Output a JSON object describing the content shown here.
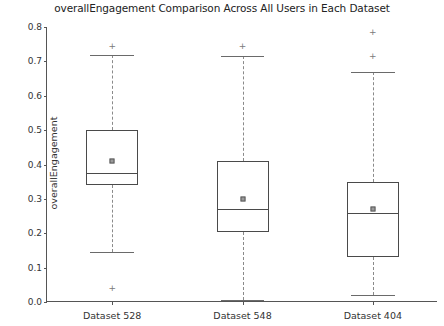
{
  "chart_data": {
    "type": "box",
    "title": "overallEngagement Comparison Across All Users in Each Dataset",
    "xlabel": "",
    "ylabel": "overallEngagement",
    "ylim": [
      0.0,
      0.8
    ],
    "yticks": [
      "0.0",
      "0.1",
      "0.2",
      "0.3",
      "0.4",
      "0.5",
      "0.6",
      "0.7",
      "0.8"
    ],
    "ytick_values": [
      0.0,
      0.1,
      0.2,
      0.3,
      0.4,
      0.5,
      0.6,
      0.7,
      0.8
    ],
    "grid": false,
    "legend": "none",
    "categories": [
      "Dataset 528",
      "Dataset 548",
      "Dataset 404"
    ],
    "boxes": [
      {
        "label": "Dataset 528",
        "whisker_low": 0.145,
        "q1": 0.34,
        "median": 0.375,
        "q3": 0.5,
        "whisker_high": 0.718,
        "mean": 0.41,
        "outliers": [
          0.745,
          0.042
        ]
      },
      {
        "label": "Dataset 548",
        "whisker_low": 0.005,
        "q1": 0.205,
        "median": 0.27,
        "q3": 0.41,
        "whisker_high": 0.715,
        "mean": 0.3,
        "outliers": [
          0.745
        ]
      },
      {
        "label": "Dataset 404",
        "whisker_low": 0.02,
        "q1": 0.13,
        "median": 0.26,
        "q3": 0.35,
        "whisker_high": 0.67,
        "mean": 0.27,
        "outliers": [
          0.785,
          0.715
        ]
      }
    ],
    "colors": {
      "box_edge": "#4a4a4a",
      "whisker": "#8a8a8a",
      "mean_marker": "#9a9a9a",
      "outlier": "#7a7a7a",
      "axis": "#555555",
      "text": "#333333",
      "background": "#ffffff"
    }
  }
}
